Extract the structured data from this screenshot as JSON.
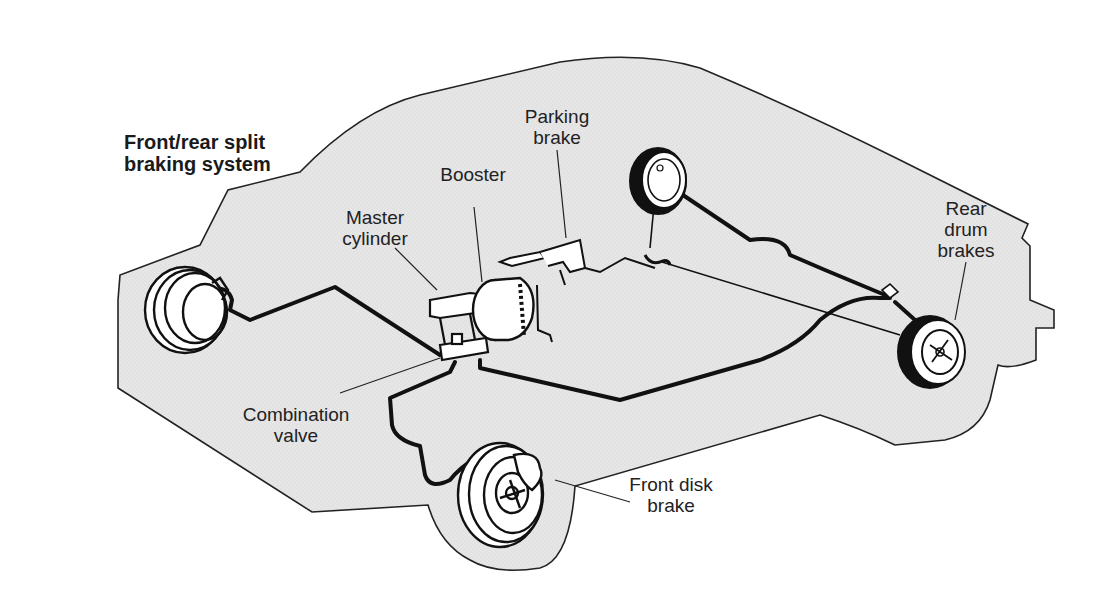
{
  "diagram": {
    "title_lines": [
      "Front/rear split",
      "braking system"
    ],
    "colors": {
      "body_fill": "#e6e6e6",
      "outline": "#222222",
      "brake_line": "#111111",
      "background": "#ffffff"
    },
    "labels": {
      "parking_brake": [
        "Parking",
        "brake"
      ],
      "booster": [
        "Booster"
      ],
      "master_cylinder": [
        "Master",
        "cylinder"
      ],
      "rear_drum_brakes": [
        "Rear",
        "drum",
        "brakes"
      ],
      "combination_valve": [
        "Combination",
        "valve"
      ],
      "front_disk_brake": [
        "Front disk",
        "brake"
      ]
    },
    "components": [
      {
        "id": "front-left-disk-brake",
        "name": "Front disk brake (left)"
      },
      {
        "id": "front-right-disk-brake",
        "name": "Front disk brake"
      },
      {
        "id": "master-cylinder",
        "name": "Master cylinder"
      },
      {
        "id": "booster",
        "name": "Booster"
      },
      {
        "id": "combination-valve",
        "name": "Combination valve"
      },
      {
        "id": "parking-brake",
        "name": "Parking brake"
      },
      {
        "id": "rear-left-drum-brake",
        "name": "Rear drum brake (left)"
      },
      {
        "id": "rear-right-drum-brake",
        "name": "Rear drum brakes"
      }
    ]
  }
}
